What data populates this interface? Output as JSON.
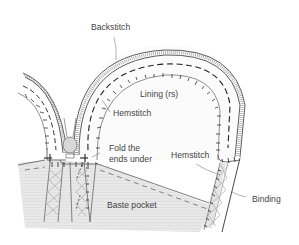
{
  "diagram": {
    "labels": {
      "backstitch": "Backstitch",
      "lining": "Lining (rs)",
      "hemstitch_top": "Hemstitch",
      "fold_line1": "Fold the",
      "fold_line2": "ends under",
      "hemstitch_right": "Hemstitch",
      "binding": "Binding",
      "baste_pocket": "Baste pocket"
    },
    "colors": {
      "line": "#333333",
      "pocket_fill": "#e6e6e6",
      "lining_fill": "#f7f7f7",
      "button_fill": "#d6d6d6",
      "label": "#444444"
    }
  }
}
